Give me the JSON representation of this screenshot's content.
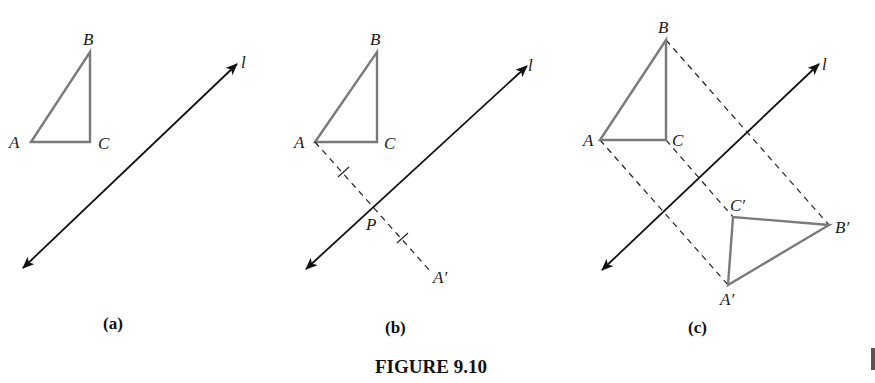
{
  "figure": {
    "caption": "FIGURE 9.10",
    "colors": {
      "triangle_stroke": "#7a7a7a",
      "line_stroke": "#111111",
      "dashed_stroke": "#222222"
    },
    "panels": [
      {
        "id": "a",
        "sublabel": "(a)",
        "line_label": "l",
        "points": {
          "A": {
            "label": "A",
            "x": 31,
            "y": 142
          },
          "B": {
            "label": "B",
            "x": 90,
            "y": 52
          },
          "C": {
            "label": "C",
            "x": 90,
            "y": 142
          }
        }
      },
      {
        "id": "b",
        "sublabel": "(b)",
        "line_label": "l",
        "points": {
          "A": {
            "label": "A",
            "x": 315,
            "y": 142
          },
          "B": {
            "label": "B",
            "x": 377,
            "y": 52
          },
          "C": {
            "label": "C",
            "x": 377,
            "y": 142
          },
          "P": {
            "label": "P",
            "x": 372,
            "y": 208
          },
          "A_prime": {
            "label": "A′",
            "x": 430,
            "y": 276
          }
        }
      },
      {
        "id": "c",
        "sublabel": "(c)",
        "line_label": "l",
        "points": {
          "A": {
            "label": "A",
            "x": 600,
            "y": 140
          },
          "B": {
            "label": "B",
            "x": 666,
            "y": 40
          },
          "C": {
            "label": "C",
            "x": 666,
            "y": 140
          },
          "A_prime": {
            "label": "A′",
            "x": 728,
            "y": 285
          },
          "B_prime": {
            "label": "B′",
            "x": 829,
            "y": 225
          },
          "C_prime": {
            "label": "C′",
            "x": 733,
            "y": 217
          }
        }
      }
    ]
  }
}
